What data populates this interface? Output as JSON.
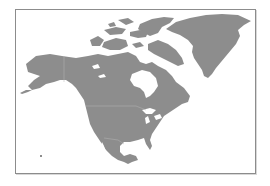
{
  "map": {
    "subject": "North America",
    "style": "monochrome gray landmass on white",
    "colors": {
      "background": "#ffffff",
      "land": "#8d8d8d",
      "border_lines": "#b4b4b4",
      "frame": "#8c8c8c",
      "water_inland": "#ffffff"
    },
    "regions": [
      {
        "name": "Greenland"
      },
      {
        "name": "Canadian Arctic Archipelago"
      },
      {
        "name": "Alaska"
      },
      {
        "name": "Canada"
      },
      {
        "name": "Hudson Bay"
      },
      {
        "name": "United States"
      },
      {
        "name": "Great Lakes"
      },
      {
        "name": "Gulf of Mexico"
      },
      {
        "name": "Mexico"
      },
      {
        "name": "Central America"
      },
      {
        "name": "Hawaii"
      }
    ]
  }
}
